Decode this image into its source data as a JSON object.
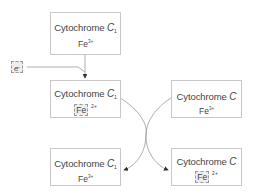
{
  "diagram": {
    "boxes": [
      {
        "id": "cyt-c1-top",
        "name": "Cytochrome",
        "symbol": "C",
        "subscript": "1",
        "iron": "Fe",
        "charge": "3+",
        "iron_highlighted": false
      },
      {
        "id": "cyt-c1-mid",
        "name": "Cytochrome",
        "symbol": "C",
        "subscript": "1",
        "iron": "Fe",
        "charge": "2+",
        "iron_highlighted": true
      },
      {
        "id": "cyt-c-mid",
        "name": "Cytochrome",
        "symbol": "C",
        "subscript": "",
        "iron": "Fe",
        "charge": "3+",
        "iron_highlighted": false
      },
      {
        "id": "cyt-c1-bottom",
        "name": "Cytochrome",
        "symbol": "C",
        "subscript": "1",
        "iron": "Fe",
        "charge": "3+",
        "iron_highlighted": false
      },
      {
        "id": "cyt-c-bottom",
        "name": "Cytochrome",
        "symbol": "C",
        "subscript": "",
        "iron": "Fe",
        "charge": "2+",
        "iron_highlighted": true
      }
    ],
    "electron": {
      "symbol": "e",
      "charge": "-"
    },
    "colors": {
      "border": "#c8c8c8",
      "line": "#999999",
      "highlight_bg": "#eeeeee"
    }
  }
}
